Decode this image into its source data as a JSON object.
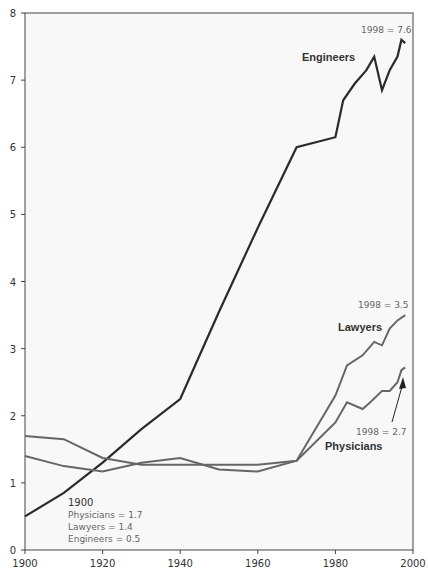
{
  "chart_data": {
    "type": "line",
    "title": "",
    "xlabel": "",
    "ylabel": "",
    "xlim": [
      1900,
      2000
    ],
    "ylim": [
      0,
      8
    ],
    "x_ticks": [
      "1900",
      "1920",
      "1940",
      "1960",
      "1980",
      "2000"
    ],
    "y_ticks": [
      "0",
      "1",
      "2",
      "3",
      "4",
      "5",
      "6",
      "7",
      "8"
    ],
    "grid": false,
    "series": [
      {
        "name": "Engineers",
        "color": "#2b2b2b",
        "x": [
          1900,
          1910,
          1920,
          1930,
          1940,
          1950,
          1960,
          1970,
          1980,
          1982,
          1985,
          1988,
          1990,
          1992,
          1994,
          1996,
          1997,
          1998
        ],
        "values": [
          0.5,
          0.85,
          1.3,
          1.8,
          2.25,
          3.55,
          4.8,
          6.0,
          6.15,
          6.7,
          6.95,
          7.15,
          7.35,
          6.85,
          7.15,
          7.35,
          7.6,
          7.55
        ]
      },
      {
        "name": "Lawyers",
        "color": "#666666",
        "x": [
          1900,
          1910,
          1920,
          1930,
          1940,
          1950,
          1960,
          1970,
          1980,
          1983,
          1987,
          1990,
          1992,
          1994,
          1996,
          1998
        ],
        "values": [
          1.4,
          1.25,
          1.17,
          1.3,
          1.37,
          1.2,
          1.17,
          1.33,
          2.3,
          2.75,
          2.9,
          3.1,
          3.05,
          3.3,
          3.42,
          3.5
        ]
      },
      {
        "name": "Physicians",
        "color": "#666666",
        "x": [
          1900,
          1910,
          1920,
          1930,
          1940,
          1950,
          1960,
          1970,
          1980,
          1983,
          1987,
          1989,
          1992,
          1994,
          1996,
          1997,
          1998
        ],
        "values": [
          1.7,
          1.65,
          1.37,
          1.27,
          1.27,
          1.27,
          1.27,
          1.33,
          1.9,
          2.2,
          2.1,
          2.2,
          2.37,
          2.37,
          2.5,
          2.68,
          2.72
        ]
      }
    ],
    "annotations": {
      "engineers_label": "Engineers",
      "engineers_end": "1998 = 7.6",
      "lawyers_label": "Lawyers",
      "lawyers_end": "1998 = 3.5",
      "physicians_label": "Physicians",
      "physicians_end": "1998 = 2.7",
      "start_year": "1900",
      "start_physicians": "Physicians = 1.7",
      "start_lawyers": "Lawyers = 1.4",
      "start_engineers": "Engineers = 0.5"
    }
  }
}
